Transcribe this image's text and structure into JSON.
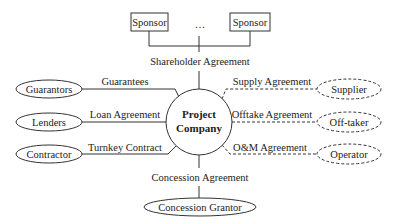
{
  "diagram": {
    "center": {
      "line1": "Project",
      "line2": "Company"
    },
    "top": {
      "sponsors": [
        "Sponsor",
        "Sponsor"
      ],
      "ellipsis": "…",
      "edge_label": "Shareholder Agreement"
    },
    "left": [
      {
        "node": "Guarantors",
        "edge_label": "Guarantees"
      },
      {
        "node": "Lenders",
        "edge_label": "Loan Agreement"
      },
      {
        "node": "Contractor",
        "edge_label": "Turnkey Contract"
      }
    ],
    "right": [
      {
        "node": "Supplier",
        "edge_label": "Supply Agreement"
      },
      {
        "node": "Off-taker",
        "edge_label": "Offtake Agreement"
      },
      {
        "node": "Operator",
        "edge_label": "O&M Agreement"
      }
    ],
    "bottom": {
      "node": "Concession Grantor",
      "edge_label": "Concession Agreement"
    }
  }
}
